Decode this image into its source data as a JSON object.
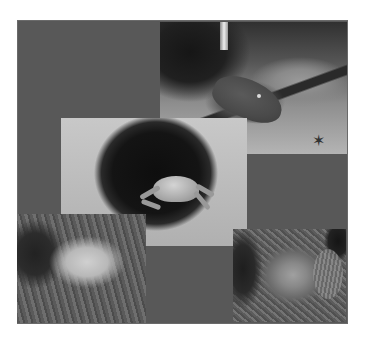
{
  "image": {
    "type": "photo-collage",
    "background_color": "#585858",
    "frame_color": "#ffffff",
    "photos": [
      {
        "subject": "moray eel on sandy seabed with starfish",
        "position": "top-right"
      },
      {
        "subject": "crab emerging from burrow",
        "position": "center"
      },
      {
        "subject": "hermit crab in shell",
        "position": "bottom-left"
      },
      {
        "subject": "scorpionfish camouflaged on seabed",
        "position": "bottom-right"
      }
    ]
  }
}
